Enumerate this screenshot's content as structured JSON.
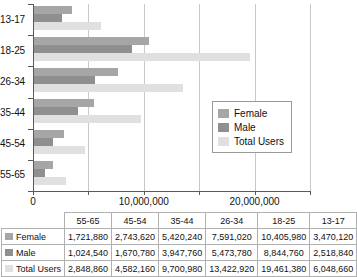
{
  "chart_data": {
    "type": "bar",
    "orientation": "horizontal",
    "title": "",
    "xlabel": "",
    "ylabel": "",
    "categories": [
      "13-17",
      "18-25",
      "26-34",
      "35-44",
      "45-54",
      "55-65"
    ],
    "series": [
      {
        "name": "Female",
        "color": "#a6a6a6",
        "values": [
          3470120,
          10405980,
          7591020,
          5420240,
          2743620,
          1721880
        ]
      },
      {
        "name": "Male",
        "color": "#8f8f8f",
        "values": [
          2518840,
          8844760,
          5473780,
          3947760,
          1670780,
          1024540
        ]
      },
      {
        "name": "Total Users",
        "color": "#e0e0e0",
        "values": [
          6048660,
          19461380,
          13422920,
          9700980,
          4582160,
          2848860
        ]
      }
    ],
    "xlim": [
      0,
      25000000
    ],
    "xticks": [
      0,
      5000000,
      10000000,
      15000000,
      20000000,
      25000000
    ],
    "xtick_labels": [
      "0",
      "",
      "10,000,000",
      "",
      "20,000,000",
      ""
    ],
    "grid": true,
    "legend_position": "center-right",
    "legend_entries": [
      "Female",
      "Male",
      "Total Users"
    ]
  },
  "legend": {
    "items": [
      {
        "label": "Female",
        "color": "#a6a6a6"
      },
      {
        "label": "Male",
        "color": "#8f8f8f"
      },
      {
        "label": "Total Users",
        "color": "#e0e0e0"
      }
    ]
  },
  "axis": {
    "y_categories": [
      "13-17",
      "18-25",
      "26-34",
      "35-44",
      "45-54",
      "55-65"
    ],
    "x_labels": [
      {
        "value": 0,
        "text": "0"
      },
      {
        "value": 10000000,
        "text": "10,000,000"
      },
      {
        "value": 20000000,
        "text": "20,000,000"
      }
    ]
  },
  "table": {
    "corner": "",
    "columns": [
      "55-65",
      "45-54",
      "35-44",
      "26-34",
      "18-25",
      "13-17"
    ],
    "rows": [
      {
        "label": "Female",
        "color": "#a6a6a6",
        "values": [
          "1,721,880",
          "2,743,620",
          "5,420,240",
          "7,591,020",
          "10,405,980",
          "3,470,120"
        ]
      },
      {
        "label": "Male",
        "color": "#8f8f8f",
        "values": [
          "1,024,540",
          "1,670,780",
          "3,947,760",
          "5,473,780",
          "8,844,760",
          "2,518,840"
        ]
      },
      {
        "label": "Total Users",
        "color": "#e0e0e0",
        "values": [
          "2,848,860",
          "4,582,160",
          "9,700,980",
          "13,422,920",
          "19,461,380",
          "6,048,660"
        ]
      }
    ]
  }
}
